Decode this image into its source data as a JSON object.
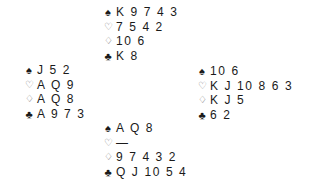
{
  "symbols": {
    "spades": "♠",
    "hearts": "♡",
    "diamonds": "♢",
    "clubs": "♣"
  },
  "hands": {
    "north": {
      "spades": "K 9 7 4 3",
      "hearts": "7 5 4 2",
      "diamonds": "10 6",
      "clubs": "K 8"
    },
    "west": {
      "spades": "J 5 2",
      "hearts": "A Q 9",
      "diamonds": "A Q 8",
      "clubs": "A 9 7 3"
    },
    "east": {
      "spades": "10 6",
      "hearts": "K J 10 8 6 3",
      "diamonds": "K J 5",
      "clubs": "6 2"
    },
    "south": {
      "spades": "A Q 8",
      "hearts": "—",
      "diamonds": "9 7 4 3 2",
      "clubs": "Q J 10 5 4"
    }
  }
}
